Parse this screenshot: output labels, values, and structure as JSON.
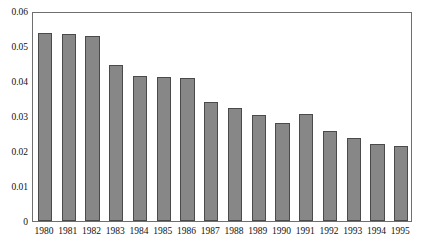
{
  "chart_data": {
    "type": "bar",
    "title": "",
    "subtitle": "",
    "xlabel": "",
    "ylabel": "",
    "categories": [
      "1980",
      "1981",
      "1982",
      "1983",
      "1984",
      "1985",
      "1986",
      "1987",
      "1988",
      "1989",
      "1990",
      "1991",
      "1992",
      "1993",
      "1994",
      "1995"
    ],
    "values": [
      0.0537,
      0.0533,
      0.0528,
      0.0447,
      0.0414,
      0.0411,
      0.0409,
      0.034,
      0.0322,
      0.0303,
      0.028,
      0.0305,
      0.0257,
      0.0237,
      0.022,
      0.0215
    ],
    "series": [
      {
        "name": "",
        "values": [
          0.0537,
          0.0533,
          0.0528,
          0.0447,
          0.0414,
          0.0411,
          0.0409,
          0.034,
          0.0322,
          0.0303,
          0.028,
          0.0305,
          0.0257,
          0.0237,
          0.022,
          0.0215
        ]
      }
    ],
    "ylim": [
      0,
      0.06
    ],
    "ytick_labels": [
      "0",
      "0.01",
      "0.02",
      "0.03",
      "0.04",
      "0.05",
      "0.06"
    ],
    "ytick_values": [
      0,
      0.01,
      0.02,
      0.03,
      0.04,
      0.05,
      0.06
    ],
    "grid": false,
    "legend": null,
    "legend_position": "none",
    "annotations": [],
    "colors": {
      "bar_fill": "#878787",
      "bar_border": "#4a4a4a",
      "axis": "#6f6f6f",
      "text": "#111111",
      "background": "#ffffff"
    }
  }
}
